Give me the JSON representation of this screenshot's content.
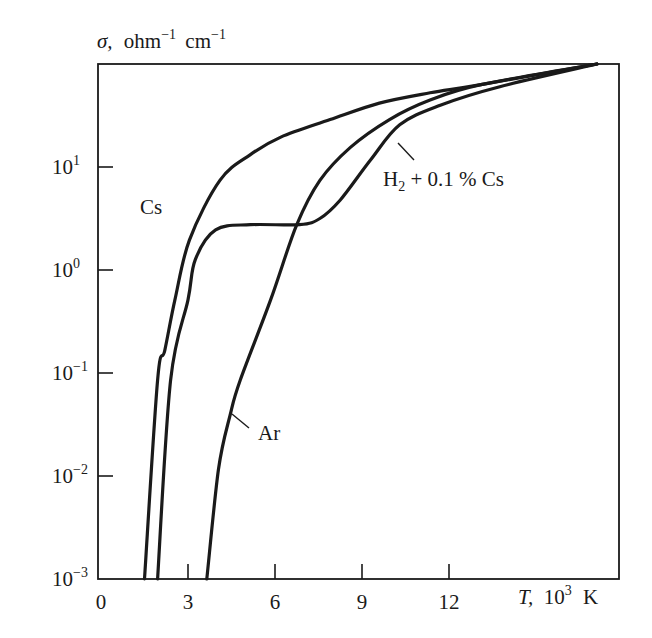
{
  "chart_data": {
    "type": "line",
    "title": "",
    "xlabel": "T, 10³ K",
    "ylabel": "σ, ohm⁻¹ cm⁻¹",
    "xlim": [
      0,
      18
    ],
    "ylim": [
      0.001,
      100
    ],
    "yscale": "log",
    "grid": false,
    "legend_position": "inline labels",
    "x_ticks": [
      0,
      3,
      6,
      9,
      12
    ],
    "x_tick_labels": [
      "0",
      "3",
      "6",
      "9",
      "12"
    ],
    "y_ticks": [
      0.001,
      0.01,
      0.1,
      1,
      10
    ],
    "y_tick_labels": [
      {
        "base": "10",
        "exp": "−3"
      },
      {
        "base": "10",
        "exp": "−2"
      },
      {
        "base": "10",
        "exp": "−1"
      },
      {
        "base": "10",
        "exp": "0"
      },
      {
        "base": "10",
        "exp": "1"
      }
    ],
    "series": [
      {
        "name": "Cs",
        "label": "Cs",
        "x": [
          1.5,
          1.95,
          2.2,
          2.55,
          3.05,
          4.1,
          5.15,
          6.2,
          7.9,
          9.6,
          11.35,
          13.1,
          17.1
        ],
        "log10_y": [
          -3.0,
          -1.07,
          -0.78,
          -0.29,
          0.29,
          0.87,
          1.12,
          1.29,
          1.46,
          1.62,
          1.72,
          1.8,
          2.0
        ],
        "y": [
          0.001,
          0.085,
          0.17,
          0.51,
          1.95,
          7.4,
          13.2,
          19.5,
          28.8,
          41.7,
          52.5,
          63.1,
          100
        ]
      },
      {
        "name": "H2 + 0.1 % Cs",
        "label": "H₂ + 0.1 % Cs",
        "x": [
          1.95,
          2.4,
          3.0,
          3.25,
          3.95,
          5.15,
          6.85,
          7.55,
          8.25,
          9.3,
          10.3,
          11.7,
          13.75,
          17.1
        ],
        "log10_y": [
          -3.0,
          -1.07,
          -0.29,
          0.1,
          0.39,
          0.44,
          0.44,
          0.5,
          0.68,
          1.07,
          1.41,
          1.6,
          1.78,
          2.0
        ],
        "y": [
          0.001,
          0.085,
          0.51,
          1.26,
          2.45,
          2.75,
          2.75,
          3.16,
          4.8,
          11.7,
          25.7,
          39.8,
          60.3,
          100
        ]
      },
      {
        "name": "Ar",
        "label": "Ar",
        "x": [
          3.65,
          4.05,
          4.45,
          4.8,
          5.85,
          6.75,
          7.55,
          8.6,
          9.95,
          11.35,
          13.1,
          17.1
        ],
        "log10_y": [
          -3.0,
          -1.94,
          -1.41,
          -1.07,
          -0.29,
          0.44,
          0.87,
          1.19,
          1.46,
          1.65,
          1.8,
          2.0
        ],
        "y": [
          0.001,
          0.0115,
          0.039,
          0.085,
          0.51,
          2.75,
          7.4,
          15.5,
          28.8,
          44.7,
          63.1,
          100
        ]
      }
    ],
    "annotations": [
      {
        "text": "Cs",
        "target": "Cs"
      },
      {
        "text": "H₂ + 0.1 % Cs",
        "target": "H2 + 0.1 % Cs"
      },
      {
        "text": "Ar",
        "target": "Ar"
      }
    ]
  },
  "labels": {
    "y_axis_sigma": "σ,",
    "y_axis_unit_ohm": "ohm",
    "y_axis_unit_ohm_exp": "−1",
    "y_axis_unit_cm": "cm",
    "y_axis_unit_cm_exp": "−1",
    "x_axis_T": "T,",
    "x_axis_base": "10",
    "x_axis_exp": "3",
    "x_axis_unit": "K",
    "curve_cs": "Cs",
    "curve_h2_pre": "H",
    "curve_h2_sub": "2",
    "curve_h2_post": " + 0.1 % Cs",
    "curve_ar": "Ar"
  }
}
